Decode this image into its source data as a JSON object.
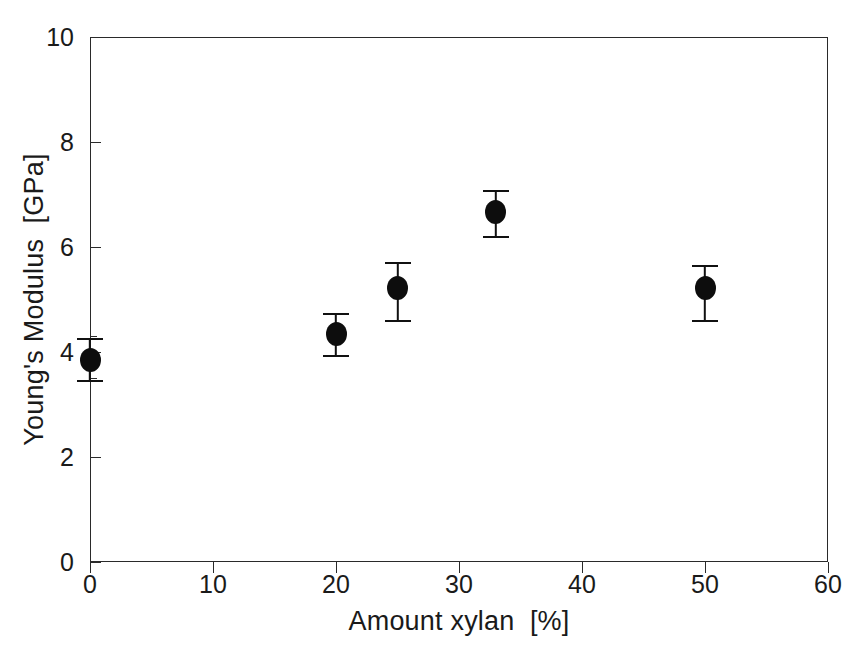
{
  "chart_data": {
    "type": "scatter",
    "title": "",
    "xlabel": "Amount xylan  [%]",
    "ylabel": "Young's Modulus  [GPa]",
    "xlim": [
      0,
      60
    ],
    "ylim": [
      0,
      10
    ],
    "xticks": [
      0,
      10,
      20,
      30,
      40,
      50,
      60
    ],
    "xtick_labels": [
      "0",
      "10",
      "20",
      "30",
      "40",
      "50",
      "60"
    ],
    "yticks": [
      0,
      2,
      4,
      6,
      8,
      10
    ],
    "ytick_labels": [
      "0",
      "2",
      "4",
      "6",
      "8",
      "10"
    ],
    "y_minor_ticks": [
      3.5,
      4.3
    ],
    "grid": false,
    "legend": null,
    "series": [
      {
        "name": "Young's Modulus",
        "marker": "filled-circle",
        "color": "#0d0d0d",
        "x": [
          0,
          20,
          25,
          33,
          50
        ],
        "y": [
          3.85,
          4.34,
          5.22,
          6.67,
          5.22
        ],
        "yerr_upper": [
          0.42,
          0.4,
          0.49,
          0.42,
          0.44
        ],
        "yerr_lower": [
          0.38,
          0.4,
          0.61,
          0.46,
          0.61
        ],
        "points": [
          {
            "x": 0,
            "y": 3.85,
            "err_top": 4.27,
            "err_bottom": 3.47
          },
          {
            "x": 20,
            "y": 4.34,
            "err_top": 4.74,
            "err_bottom": 3.94
          },
          {
            "x": 25,
            "y": 5.22,
            "err_top": 5.71,
            "err_bottom": 4.61
          },
          {
            "x": 33,
            "y": 6.67,
            "err_top": 7.09,
            "err_bottom": 6.21
          },
          {
            "x": 50,
            "y": 5.22,
            "err_top": 5.66,
            "err_bottom": 4.61
          }
        ]
      }
    ]
  }
}
